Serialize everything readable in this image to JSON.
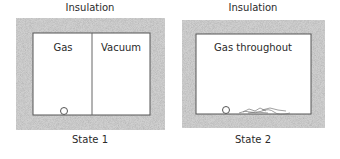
{
  "diagrams": [
    {
      "id": "state1",
      "insulation_label": "Insulation",
      "compartments": [
        "Gas",
        "Vacuum"
      ],
      "state_label": "State 1"
    },
    {
      "id": "state2",
      "insulation_label": "Insulation",
      "compartments": [
        "Gas throughout"
      ],
      "state_label": "State 2"
    }
  ],
  "colors": {
    "insulation": "#bdbdbd",
    "wall": "#555555",
    "background": "#ffffff"
  }
}
